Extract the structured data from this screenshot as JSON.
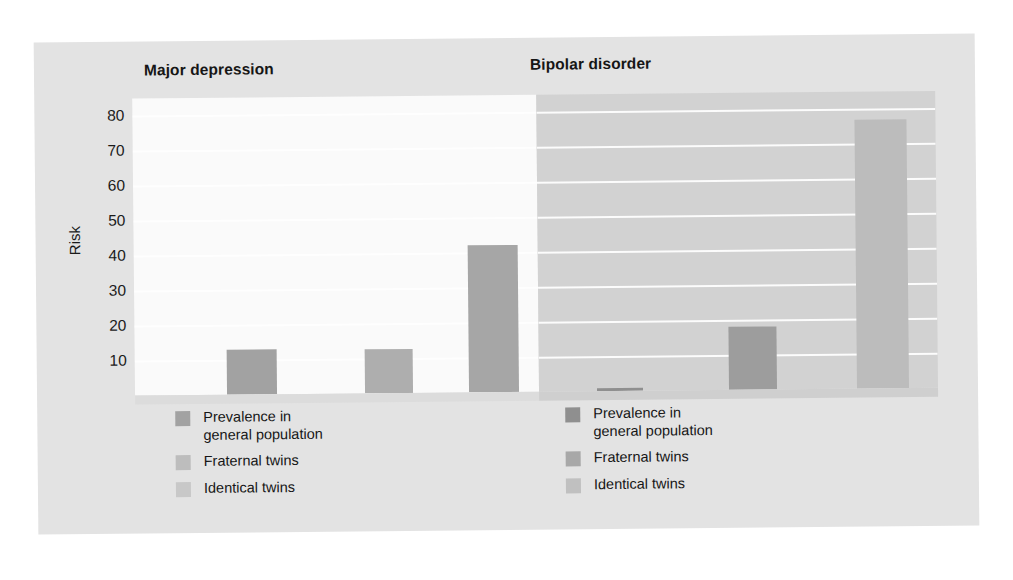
{
  "chart_data": {
    "type": "bar",
    "title": "",
    "xlabel": "",
    "ylabel": "Risk",
    "ylim": [
      0,
      85
    ],
    "grid": true,
    "legend_position": "below-panel",
    "tick_labels": [
      "80",
      "70",
      "60",
      "50",
      "40",
      "30",
      "20",
      "10"
    ],
    "ticks": [
      80,
      70,
      60,
      50,
      40,
      30,
      20,
      10
    ],
    "categories": [
      "Prevalence in\ngeneral population",
      "Fraternal twins",
      "Identical twins"
    ],
    "panels": [
      {
        "name": "Major depression",
        "title": "Major depression",
        "values": [
          13,
          12.5,
          42
        ],
        "legend": [
          {
            "label": "Prevalence in\ngeneral population",
            "color": "#a2a2a2"
          },
          {
            "label": "Fraternal twins",
            "color": "#bdbdbd"
          },
          {
            "label": "Identical twins",
            "color": "#c8c8c8"
          }
        ]
      },
      {
        "name": "Bipolar disorder",
        "title": "Bipolar disorder",
        "values": [
          1,
          18,
          77
        ],
        "legend": [
          {
            "label": "Prevalence in\ngeneral population",
            "color": "#8f8f8f"
          },
          {
            "label": "Fraternal twins",
            "color": "#a8a8a8"
          },
          {
            "label": "Identical twins",
            "color": "#c0c0c0"
          }
        ]
      }
    ]
  },
  "figure": {
    "y_axis_label": "Risk",
    "panel_left_title": "Major depression",
    "panel_right_title": "Bipolar disorder",
    "background_color": "#e3e3e3",
    "plot_left_color": "#fafafa",
    "plot_right_color": "#d2d2d2",
    "gridline_color": "#ffffff"
  }
}
